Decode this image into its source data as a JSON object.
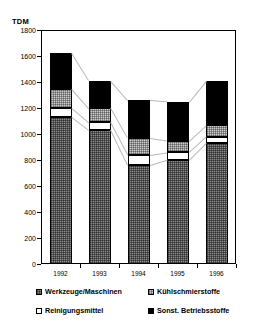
{
  "top_strip_text": "",
  "axis": {
    "unit_label": "TDM",
    "y_ticks": [
      0,
      200,
      400,
      600,
      800,
      1000,
      1200,
      1400,
      1600,
      1800
    ],
    "x_ticks": [
      "1992",
      "1993",
      "1994",
      "1995",
      "1996"
    ]
  },
  "legend": {
    "items": [
      {
        "label": "Werkzeuge/Maschinen",
        "pattern": "dark-checker",
        "color": "#8a8a8a"
      },
      {
        "label": "Kühlschmierstoffe",
        "pattern": "light-checker",
        "color": "#cccccc"
      },
      {
        "label": "Reinigungsmittel",
        "pattern": "solid",
        "color": "#ffffff"
      },
      {
        "label": "Sonst. Betriebsstoffe",
        "pattern": "solid",
        "color": "#000000"
      }
    ]
  },
  "chart_data": {
    "type": "bar",
    "stacked": true,
    "title": "",
    "xlabel": "",
    "ylabel": "TDM",
    "ylim": [
      0,
      1800
    ],
    "grid": false,
    "legend_position": "bottom",
    "categories": [
      "1992",
      "1993",
      "1994",
      "1995",
      "1996"
    ],
    "series": [
      {
        "name": "Werkzeuge/Maschinen",
        "values": [
          1130,
          1030,
          760,
          800,
          930
        ]
      },
      {
        "name": "Reinigungsmittel",
        "values": [
          70,
          60,
          80,
          60,
          50
        ]
      },
      {
        "name": "Kühlschmierstoffe",
        "values": [
          150,
          110,
          130,
          90,
          90
        ]
      },
      {
        "name": "Sonst. Betriebsstoffe",
        "values": [
          270,
          210,
          290,
          300,
          340
        ]
      }
    ],
    "totals": [
      1620,
      1410,
      1260,
      1250,
      1410
    ]
  }
}
